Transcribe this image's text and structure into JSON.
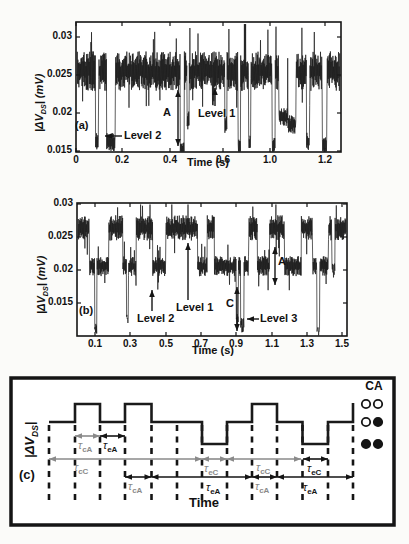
{
  "figure": {
    "background": "#fbfbf9",
    "trace_color": "#1a1a1a",
    "gray": "#8a8a8a",
    "black": "#151515"
  },
  "chart_data": [
    {
      "panel": "a",
      "type": "line",
      "letter": "(a)",
      "xlabel": "Time (s)",
      "ylabel_pre": "|ΔV",
      "ylabel_sub": "DS",
      "ylabel_post": "| (mV)",
      "ylim": [
        0.0149,
        0.032
      ],
      "xticklabels": [
        "0",
        "0.2",
        "0.4",
        "0.6",
        "1.0",
        "1.2"
      ],
      "yticklabels": [
        "0.03",
        "0.025",
        "0.02",
        "0.015"
      ],
      "yticks": [
        {
          "label": "0.03",
          "y": 37
        },
        {
          "label": "0.025",
          "y": 75
        },
        {
          "label": "0.02",
          "y": 113
        },
        {
          "label": "0.015",
          "y": 151
        }
      ],
      "xticks": [
        {
          "label": "0",
          "x": 76
        },
        {
          "label": "0.2",
          "x": 122
        },
        {
          "label": "0.4",
          "x": 170
        },
        {
          "label": "0.6",
          "x": 223
        },
        {
          "label": "1.0",
          "x": 270
        },
        {
          "label": "1.2",
          "x": 325
        }
      ],
      "box": {
        "l": 76,
        "t": 22,
        "r": 341,
        "b": 152
      },
      "signal": {
        "seed": 7,
        "samples": 850,
        "level1": 0.0255,
        "level2": 0.0175,
        "base": 0.0255,
        "amp": 0.0026,
        "dips": [
          [
            0.07,
            0.082,
            0.0163
          ],
          [
            0.112,
            0.145,
            0.0162
          ],
          [
            0.392,
            0.408,
            0.0152
          ],
          [
            0.418,
            0.426,
            0.019
          ],
          [
            0.562,
            0.57,
            0.0185
          ],
          [
            0.612,
            0.622,
            0.0155
          ],
          [
            0.652,
            0.66,
            0.016
          ],
          [
            0.742,
            0.754,
            0.0158
          ],
          [
            0.768,
            0.8,
            0.0195
          ],
          [
            0.802,
            0.832,
            0.0185
          ],
          [
            0.872,
            0.884,
            0.0163
          ],
          [
            0.932,
            0.95,
            0.0158
          ]
        ],
        "upspike": [
          0.636,
          0.642,
          0.0317
        ]
      },
      "annotations": [
        {
          "text": "Level 2",
          "tx": 124,
          "ty": 130,
          "arrow": [
            122,
            136,
            105,
            136
          ],
          "heads": "end"
        },
        {
          "text": "A",
          "tx": 163,
          "ty": 107,
          "arrow": [
            178,
            90,
            178,
            146
          ],
          "heads": "both"
        },
        {
          "text": "Level 1",
          "tx": 198,
          "ty": 108,
          "arrow": [
            215,
            106,
            215,
            88
          ],
          "heads": "end"
        }
      ]
    },
    {
      "panel": "b",
      "type": "line",
      "letter": "(b)",
      "xlabel": "Time (s)",
      "ylabel_pre": "|ΔV",
      "ylabel_sub": "DS",
      "ylabel_post": "| (mV)",
      "ylim": [
        0.0101,
        0.03
      ],
      "xticklabels": [
        "0.1",
        "0.3",
        "0.5",
        "0.7",
        "0.9",
        "1.1",
        "1.3",
        "1.5"
      ],
      "yticklabels": [
        "0.03",
        "0.025",
        "0.02",
        "0.015"
      ],
      "yticks": [
        {
          "label": "0.03",
          "y": 204
        },
        {
          "label": "0.025",
          "y": 237
        },
        {
          "label": "0.02",
          "y": 270
        },
        {
          "label": "0.015",
          "y": 303
        }
      ],
      "xticks": [
        {
          "label": "0.1",
          "x": 95
        },
        {
          "label": "0.3",
          "x": 130
        },
        {
          "label": "0.5",
          "x": 166
        },
        {
          "label": "0.7",
          "x": 201
        },
        {
          "label": "0.9",
          "x": 236
        },
        {
          "label": "1.1",
          "x": 272
        },
        {
          "label": "1.3",
          "x": 307
        },
        {
          "label": "1.5",
          "x": 342
        }
      ],
      "box": {
        "l": 77,
        "t": 203,
        "r": 347,
        "b": 336
      },
      "signal": {
        "seed": 11,
        "samples": 860,
        "tmax": 1.525,
        "L1": {
          "c": 0.0262,
          "a": 0.0019
        },
        "L2": {
          "c": 0.0205,
          "a": 0.0015
        },
        "level3": 0.011,
        "segments": [
          [
            0,
            0.065,
            "L1"
          ],
          [
            0.065,
            0.175,
            "L2"
          ],
          [
            0.175,
            0.255,
            "L1"
          ],
          [
            0.255,
            0.33,
            "L2"
          ],
          [
            0.33,
            0.425,
            "L1"
          ],
          [
            0.425,
            0.5,
            "L2"
          ],
          [
            0.5,
            0.68,
            "L1"
          ],
          [
            0.68,
            0.735,
            "L2"
          ],
          [
            0.735,
            0.775,
            "L1"
          ],
          [
            0.775,
            0.97,
            "L2"
          ],
          [
            0.97,
            1.02,
            "L1"
          ],
          [
            1.02,
            1.09,
            "L2"
          ],
          [
            1.09,
            1.175,
            "L1"
          ],
          [
            1.175,
            1.27,
            "L2"
          ],
          [
            1.27,
            1.335,
            "L1"
          ],
          [
            1.335,
            1.425,
            "L2"
          ],
          [
            1.425,
            1.525,
            "L1"
          ]
        ],
        "deep": [
          [
            0.095,
            0.107,
            0.0105
          ],
          [
            0.275,
            0.287,
            0.012
          ],
          [
            0.9,
            0.912,
            0.0115
          ],
          [
            0.925,
            0.945,
            0.011
          ],
          [
            1.36,
            1.376,
            0.0103
          ],
          [
            1.445,
            1.462,
            0.0192
          ]
        ]
      },
      "annotations": [
        {
          "text": "Level 2",
          "tx": 137,
          "ty": 313,
          "arrow": [
            152,
            311,
            152,
            290
          ],
          "heads": "end"
        },
        {
          "text": "Level 1",
          "tx": 176,
          "ty": 302,
          "arrow": [
            188,
            300,
            188,
            243
          ],
          "heads": "end"
        },
        {
          "text": "C",
          "tx": 226,
          "ty": 298,
          "arrow": [
            237,
            287,
            237,
            331
          ],
          "heads": "both"
        },
        {
          "text": "Level 3",
          "tx": 260,
          "ty": 313,
          "arrow": [
            259,
            319,
            247,
            319
          ],
          "heads": "end"
        },
        {
          "text": "A",
          "tx": 278,
          "ty": 256,
          "arrow": [
            275,
            247,
            275,
            285
          ],
          "heads": "both"
        }
      ]
    },
    {
      "panel": "c",
      "type": "schematic",
      "letter": "(c)",
      "xlabel": "Time",
      "ylabel_pre": "|ΔV",
      "ylabel_sub": "DS",
      "ylabel_post": "|",
      "legend_title": "CA",
      "box": {
        "l": 11,
        "t": 378,
        "r": 394,
        "b": 525,
        "lw": 3.5
      },
      "levels": {
        "high": 404,
        "mid": 422,
        "low": 444
      },
      "dashed_x": [
        49,
        75,
        100,
        125,
        151.5,
        177,
        202,
        227,
        252,
        277,
        302.5,
        328,
        353
      ],
      "dash_y": [
        425,
        505
      ],
      "waveform": [
        [
          49,
          422
        ],
        [
          75,
          422
        ],
        [
          75,
          404
        ],
        [
          100,
          404
        ],
        [
          100,
          422
        ],
        [
          125,
          422
        ],
        [
          125,
          404
        ],
        [
          151.5,
          404
        ],
        [
          151.5,
          422
        ],
        [
          202,
          422
        ],
        [
          202,
          444
        ],
        [
          227,
          444
        ],
        [
          227,
          422
        ],
        [
          252,
          422
        ],
        [
          252,
          404
        ],
        [
          277,
          404
        ],
        [
          277,
          422
        ],
        [
          302.5,
          422
        ],
        [
          302.5,
          444
        ],
        [
          328,
          444
        ],
        [
          328,
          422
        ],
        [
          353,
          422
        ],
        [
          353,
          403
        ]
      ],
      "tau_main": "τ",
      "tau_arrows": [
        {
          "x1": 75,
          "x2": 100,
          "y": 436,
          "color": "#8a8a8a",
          "sub": "cA",
          "lx": 78,
          "ly": 440,
          "lcolor": "#8a8a8a"
        },
        {
          "x1": 100,
          "x2": 125,
          "y": 436,
          "color": "#151515",
          "sub": "eA",
          "lx": 103,
          "ly": 440,
          "lcolor": "#151515"
        },
        {
          "x1": 49,
          "x2": 202,
          "y": 459,
          "color": "#8a8a8a",
          "sub": "cC",
          "lx": 74,
          "ly": 462,
          "lcolor": "#8a8a8a"
        },
        {
          "x1": 202,
          "x2": 227,
          "y": 459,
          "color": "#8a8a8a",
          "sub": "eC",
          "lx": 204,
          "ly": 463,
          "lcolor": "#8a8a8a"
        },
        {
          "x1": 227,
          "x2": 301,
          "y": 459,
          "color": "#8a8a8a",
          "sub": "cC",
          "lx": 256,
          "ly": 462,
          "lcolor": "#8a8a8a"
        },
        {
          "x1": 303,
          "x2": 328,
          "y": 459,
          "color": "#151515",
          "sub": "eC",
          "lx": 307,
          "ly": 463,
          "lcolor": "#151515"
        },
        {
          "x1": 125,
          "x2": 151.5,
          "y": 477,
          "color": "#151515",
          "sub": "cA",
          "lx": 128,
          "ly": 481,
          "lcolor": "#8a8a8a"
        },
        {
          "x1": 151.5,
          "x2": 252,
          "y": 477,
          "color": "#151515",
          "sub": "eA",
          "lx": 206,
          "ly": 482,
          "lcolor": "#151515"
        },
        {
          "x1": 252,
          "x2": 277,
          "y": 477,
          "color": "#151515",
          "sub": "cA",
          "lx": 255,
          "ly": 481,
          "lcolor": "#8a8a8a"
        },
        {
          "x1": 277,
          "x2": 353,
          "y": 477,
          "color": "#151515",
          "sub": "eA",
          "lx": 303,
          "ly": 482,
          "lcolor": "#151515"
        }
      ],
      "legend": {
        "x": [
          366,
          378
        ],
        "r": 4.2,
        "rows": [
          {
            "y": 404,
            "fill": [
              "open",
              "open"
            ]
          },
          {
            "y": 422,
            "fill": [
              "open",
              "filled"
            ]
          },
          {
            "y": 444,
            "fill": [
              "filled",
              "filled"
            ]
          }
        ]
      }
    }
  ]
}
